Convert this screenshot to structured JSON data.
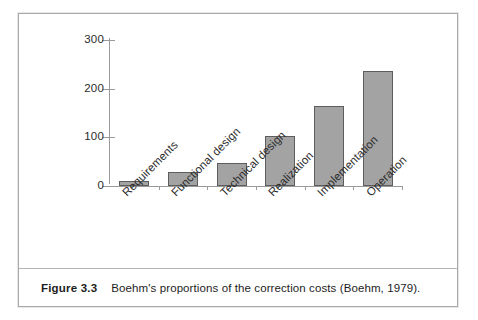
{
  "figure": {
    "caption_label": "Figure 3.3",
    "caption_text": "Boehm's proportions of the correction costs (Boehm, 1979).",
    "border_color": "#a9a9a9"
  },
  "chart_data": {
    "type": "bar",
    "title": "",
    "subtitle": "",
    "xlabel": "",
    "ylabel": "",
    "categories": [
      "Requirements",
      "Functional design",
      "Technical design",
      "Realization",
      "Implementation",
      "Operation"
    ],
    "values": [
      10,
      28,
      48,
      102,
      165,
      237
    ],
    "ylim": [
      0,
      300
    ],
    "yticks": [
      0,
      100,
      200,
      300
    ],
    "ytick_labels": [
      "0",
      "100",
      "200",
      "300"
    ],
    "grid": false,
    "legend": null,
    "bar_fill_color": "#a3a3a3",
    "bar_edge_color": "#5d5d5d",
    "axis_color": "#9a9a9a",
    "tick_label_color": "#2b2b2b"
  }
}
